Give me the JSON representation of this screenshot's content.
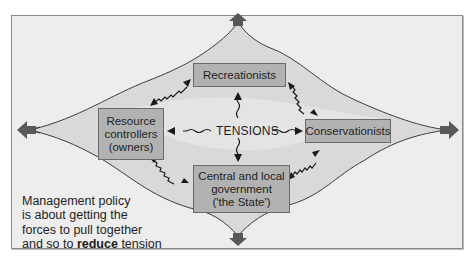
{
  "diagram": {
    "title": "",
    "center_label": "TENSIONS",
    "nodes": [
      {
        "id": "recreationists",
        "lines": [
          "Recreationists"
        ],
        "position": "top"
      },
      {
        "id": "resource-controllers",
        "lines": [
          "Resource",
          "controllers",
          "(owners)"
        ],
        "position": "left"
      },
      {
        "id": "conservationists",
        "lines": [
          "Conservationists"
        ],
        "position": "right"
      },
      {
        "id": "government",
        "lines": [
          "Central and local",
          "government",
          "('the State')"
        ],
        "position": "bottom"
      }
    ],
    "edges": [
      {
        "from": "TENSIONS",
        "to": "recreationists",
        "style": "wavy-arrow"
      },
      {
        "from": "TENSIONS",
        "to": "resource-controllers",
        "style": "wavy-arrow"
      },
      {
        "from": "TENSIONS",
        "to": "conservationists",
        "style": "wavy-arrow"
      },
      {
        "from": "TENSIONS",
        "to": "government",
        "style": "wavy-arrow"
      },
      {
        "from": "recreationists",
        "to": "resource-controllers",
        "style": "wavy-double-arrow"
      },
      {
        "from": "recreationists",
        "to": "conservationists",
        "style": "wavy-double-arrow"
      },
      {
        "from": "resource-controllers",
        "to": "government",
        "style": "wavy-double-arrow"
      },
      {
        "from": "conservationists",
        "to": "government",
        "style": "wavy-double-arrow"
      }
    ],
    "outer_arrows": [
      "up",
      "left",
      "right",
      "down"
    ],
    "caption": {
      "line1": "Management policy",
      "line2": "is about getting the",
      "line3": "forces to pull together",
      "line4_pre": "and so to ",
      "line4_bold": "reduce",
      "line4_post": " tension"
    },
    "colors": {
      "background": "#ededed",
      "box_fill": "#b2b2b2",
      "box_border": "#6a6a6a",
      "outer_arrow": "#5a5a5a",
      "line": "#2a2a2a",
      "landscape_tint": "#d4d4d4"
    }
  }
}
